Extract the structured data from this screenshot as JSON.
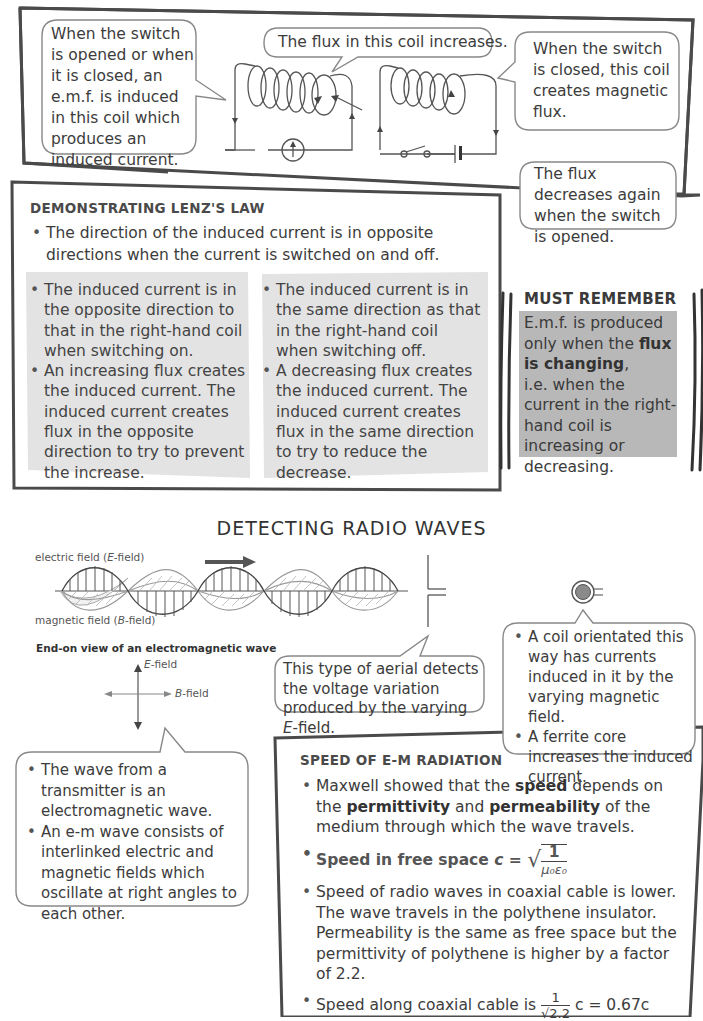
{
  "top_diagram": {
    "callout_left": "When the switch is opened or when it is closed, an e.m.f. is induced in this coil which produces an induced current.",
    "callout_top": "The flux in this coil increases.",
    "callout_right": "When the switch is closed, this coil creates magnetic flux.",
    "callout_bottom_right": "The flux decreases again when the switch is opened."
  },
  "lenz": {
    "heading": "DEMONSTRATING LENZ'S LAW",
    "intro_bullet": "The direction of the induced current is in opposite directions when the current is switched on and off.",
    "left_panel": [
      "The induced current is in the opposite direction to that in the right-hand coil when switching on.",
      "An increasing flux creates the induced current. The induced current creates flux in the opposite direction to try to prevent the increase."
    ],
    "right_panel": [
      "The induced current is in the same direction as that in the right-hand coil when switching off.",
      "A decreasing flux creates the induced current. The induced current creates flux in the same direction to try to reduce the decrease."
    ]
  },
  "must_remember": {
    "heading": "MUST REMEMBER",
    "text_1": "E.m.f. is produced only when the ",
    "bold": "flux is changing",
    "text_2": ",",
    "text_3": "i.e. when the current in the right-hand coil is increasing or decreasing."
  },
  "radio": {
    "title": "DETECTING RADIO WAVES",
    "wave_label_e": "electric field (",
    "wave_label_e_italic": "E",
    "wave_label_e_end": "-field)",
    "wave_label_b": "magnetic field (",
    "wave_label_b_italic": "B",
    "wave_label_b_end": "-field)",
    "end_on_title": "End-on view of an electromagnetic wave",
    "axis_e_italic": "E",
    "axis_e": "-field",
    "axis_b_italic": "B",
    "axis_b": "-field",
    "aerial_callout_1": "This type of aerial detects the voltage variation produced by the varying ",
    "aerial_callout_italic": "E",
    "aerial_callout_2": "-field.",
    "coil_callout": [
      "A coil orientated this way has currents induced in it by the varying magnetic field.",
      "A ferrite core increases the induced current."
    ],
    "wave_callout": [
      "The wave from a transmitter is an electromagnetic wave.",
      "An e-m wave consists of interlinked electric and magnetic fields which oscillate at right angles to each other."
    ]
  },
  "speed": {
    "heading": "SPEED OF E-M RADIATION",
    "b1_a": "Maxwell showed that the ",
    "b1_bold1": "speed",
    "b1_b": " depends on the ",
    "b1_bold2": "permittivity",
    "b1_c": " and ",
    "b1_bold3": "permeability",
    "b1_d": " of the medium through which the wave travels.",
    "b2_label": "Speed in free space ",
    "b2_c": "c",
    "b2_eq": " = ",
    "b2_num": "1",
    "b2_den": "μ₀ε₀",
    "b3": "Speed of radio waves in coaxial cable is lower. The wave travels in the polythene insulator. Permeability is the same as free space but the permittivity of polythene is higher by a factor of 2.2.",
    "b4_a": "Speed along coaxial cable is ",
    "b4_num": "1",
    "b4_den": "√2.2",
    "b4_b": " c = 0.67c"
  },
  "colors": {
    "border": "#4a4a4a",
    "panel_grey": "#e3e3e3",
    "must_grey": "#b8b8b8",
    "text": "#3c3c3c"
  }
}
